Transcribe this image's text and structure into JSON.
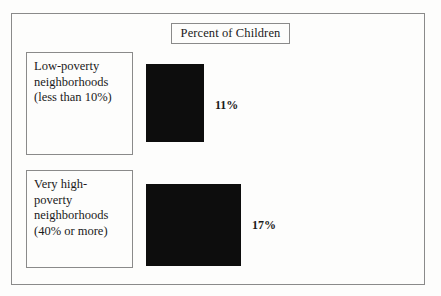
{
  "chart_data": {
    "type": "bar",
    "title": "Percent of Children",
    "xlabel": "",
    "ylabel": "",
    "orientation": "horizontal",
    "grid": false,
    "legend": "none",
    "categories": [
      "Low-poverty neighborhoods (less than 10%)",
      "Very high-poverty neighborhoods (40% or more)"
    ],
    "values": [
      11,
      17
    ],
    "value_labels": [
      "11%",
      "17%"
    ],
    "units": "percent"
  },
  "figure": {
    "title_box": {
      "text": "Percent of Children"
    },
    "rows": [
      {
        "label_lines": [
          "Low-poverty",
          "neighborhoods",
          "(less than 10%)"
        ],
        "value_label": "11%"
      },
      {
        "label_lines": [
          "Very high-",
          "poverty",
          "neighborhoods",
          "(40% or more)"
        ],
        "value_label": "17%"
      }
    ]
  },
  "colors": {
    "bar": "#0d0d0d",
    "frame": "#8a8a8a",
    "background": "#fdfdfc",
    "text": "#1a1a1a"
  }
}
